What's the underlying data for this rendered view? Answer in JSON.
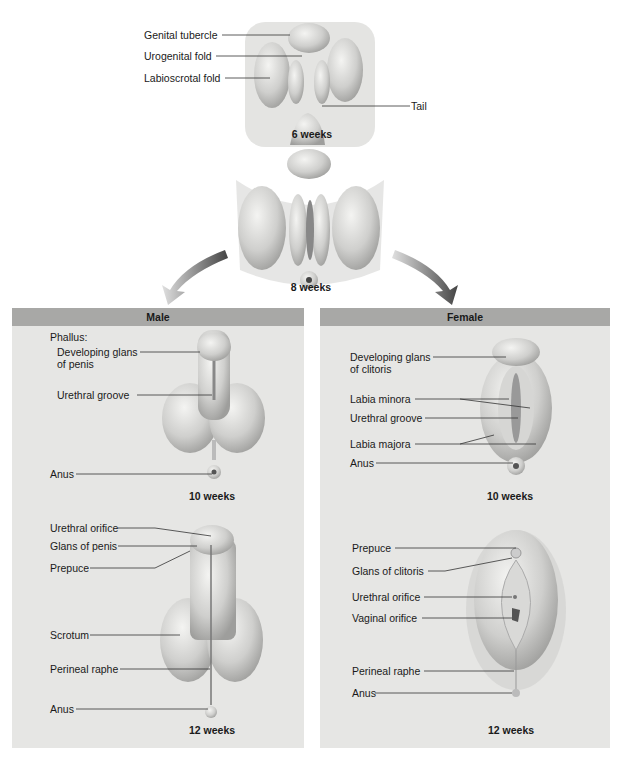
{
  "top": {
    "stage6": {
      "caption": "6 weeks",
      "labels": [
        "Genital tubercle",
        "Urogenital fold",
        "Labioscrotal fold",
        "Tail"
      ]
    },
    "stage8": {
      "caption": "8 weeks"
    }
  },
  "male": {
    "title": "Male",
    "stage10": {
      "caption": "10 weeks",
      "heading": "Phallus:",
      "labels": [
        "Developing glans",
        "of penis",
        "Urethral groove",
        "Anus"
      ]
    },
    "stage12": {
      "caption": "12 weeks",
      "labels": [
        "Urethral orifice",
        "Glans of penis",
        "Prepuce",
        "Scrotum",
        "Perineal raphe",
        "Anus"
      ]
    }
  },
  "female": {
    "title": "Female",
    "stage10": {
      "caption": "10 weeks",
      "labels": [
        "Developing glans",
        "of clitoris",
        "Labia minora",
        "Urethral groove",
        "Labia majora",
        "Anus"
      ]
    },
    "stage12": {
      "caption": "12 weeks",
      "labels": [
        "Prepuce",
        "Glans of clitoris",
        "Urethral orifice",
        "Vaginal orifice",
        "Perineal raphe",
        "Anus"
      ]
    }
  },
  "colors": {
    "panel_bg": "#e6e6e4",
    "panel_header": "#a8a8a6",
    "arrow": "#555555"
  }
}
